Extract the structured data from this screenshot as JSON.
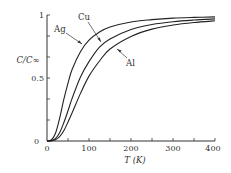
{
  "chart_data": {
    "type": "line",
    "title": "",
    "xlabel": "T (K)",
    "ylabel": "C/C∞",
    "xlim": [
      0,
      400
    ],
    "ylim": [
      0,
      1
    ],
    "x_ticks": [
      0,
      100,
      200,
      300,
      400
    ],
    "x_minor_step": 50,
    "y_ticks": [
      0,
      0.5,
      1
    ],
    "y_tick_labels": [
      "0",
      "0.5",
      "1"
    ],
    "y_minor_step": 0.1667,
    "grid": false,
    "legend": "inline labels with leader arrows",
    "x": [
      0,
      10,
      20,
      30,
      40,
      50,
      60,
      80,
      100,
      125,
      150,
      200,
      250,
      300,
      350,
      400
    ],
    "series": [
      {
        "name": "Ag",
        "values": [
          0,
          0.008,
          0.06,
          0.18,
          0.33,
          0.46,
          0.57,
          0.71,
          0.8,
          0.865,
          0.905,
          0.945,
          0.963,
          0.975,
          0.981,
          0.985
        ]
      },
      {
        "name": "Cu",
        "values": [
          0,
          0.003,
          0.019,
          0.065,
          0.145,
          0.24,
          0.34,
          0.51,
          0.63,
          0.745,
          0.81,
          0.885,
          0.925,
          0.947,
          0.96,
          0.969
        ]
      },
      {
        "name": "Al",
        "values": [
          0,
          0.002,
          0.01,
          0.035,
          0.082,
          0.15,
          0.225,
          0.38,
          0.515,
          0.635,
          0.73,
          0.83,
          0.888,
          0.92,
          0.94,
          0.954
        ]
      }
    ],
    "annotations": [
      {
        "text": "Ag",
        "label_xy": [
          54,
          32
        ],
        "arrow_to": [
          82,
          44
        ]
      },
      {
        "text": "Cu",
        "label_xy": [
          78,
          20
        ],
        "arrow_to": [
          101,
          42
        ]
      },
      {
        "text": "Al",
        "label_xy": [
          126,
          64
        ],
        "arrow_to": [
          117,
          49
        ]
      }
    ]
  },
  "labels": {
    "x_axis": "T (K)",
    "y_axis": "C/C∞",
    "ag": "Ag",
    "cu": "Cu",
    "al": "Al",
    "x0": "0",
    "x100": "100",
    "x200": "200",
    "x300": "300",
    "x400": "400",
    "y0": "0",
    "y05": "0.5",
    "y1": "1"
  }
}
